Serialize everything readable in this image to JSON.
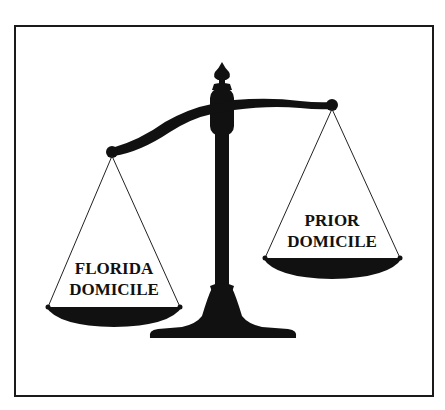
{
  "header": {
    "title": ""
  },
  "diagram": {
    "left_pan": {
      "label_line1": "FLORIDA",
      "label_line2": "DOMICILE",
      "position": "lower"
    },
    "right_pan": {
      "label_line1": "PRIOR",
      "label_line2": "DOMICILE",
      "position": "higher"
    },
    "colors": {
      "ink": "#111111",
      "background": "#ffffff",
      "frame": "#1a1a1a"
    }
  }
}
